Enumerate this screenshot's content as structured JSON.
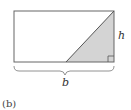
{
  "figure": {
    "caption": "(b)",
    "labels": {
      "height": "h",
      "base": "b"
    },
    "colors": {
      "stroke": "#666666",
      "shade": "#d4d4d4",
      "background": "#ffffff"
    },
    "shapes": {
      "rectangle": "rectangle with base b and height h",
      "triangle": "shaded right triangle inside rectangle, right angle at bottom-right"
    }
  }
}
